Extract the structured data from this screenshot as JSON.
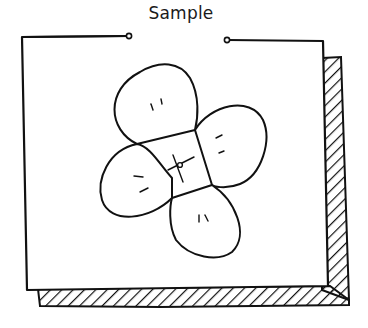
{
  "card": {
    "title": "Sample",
    "stroke_color": "#111111",
    "background": "#ffffff"
  },
  "illustration": {
    "subject": "flower-icon",
    "petals": 4
  }
}
